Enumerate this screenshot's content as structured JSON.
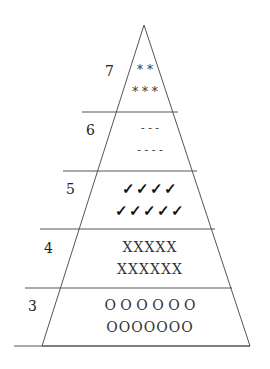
{
  "diagram": {
    "type": "pyramid",
    "levels": [
      {
        "label": "7",
        "rows": [
          "* *",
          "* * *"
        ]
      },
      {
        "label": "6",
        "rows": [
          "- - -",
          "- - - -"
        ]
      },
      {
        "label": "5",
        "rows": [
          "✓✓✓✓",
          "✓✓✓✓✓"
        ]
      },
      {
        "label": "4",
        "rows": [
          "XXXXX",
          "XXXXXX"
        ]
      },
      {
        "label": "3",
        "rows": [
          "O O O O O O",
          "OOOOOOO"
        ]
      }
    ]
  }
}
